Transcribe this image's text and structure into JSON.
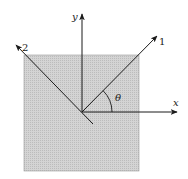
{
  "diagram": {
    "title": "",
    "labels": {
      "x_axis": "x",
      "y_axis": "y",
      "axis1": "1",
      "axis2": "2",
      "angle": "θ"
    },
    "colors": {
      "square_fill": "#cfcfcf",
      "line": "#1a1a1a",
      "background": "#ffffff"
    },
    "geometry": {
      "square": {
        "x": 24,
        "y": 55,
        "w": 115,
        "h": 116
      },
      "origin": [
        82,
        112
      ],
      "x_axis_end": [
        177,
        112
      ],
      "y_axis_end": [
        82,
        14
      ],
      "axis1_end": [
        157,
        34
      ],
      "axis2_end": [
        15,
        44
      ],
      "tail_end": [
        93,
        124
      ],
      "angle_deg": 45
    }
  }
}
